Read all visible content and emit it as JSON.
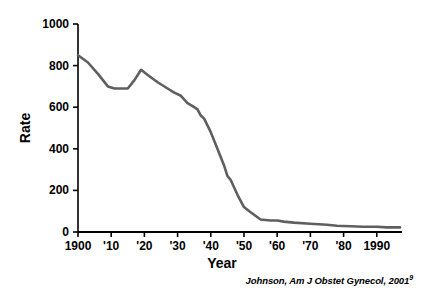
{
  "chart_data": {
    "type": "line",
    "title": "",
    "xlabel": "Year",
    "ylabel": "Rate",
    "xlim": [
      1900,
      1997
    ],
    "ylim": [
      0,
      1000
    ],
    "grid": false,
    "legend": null,
    "line_color": "#5f5f5f",
    "axis_color": "#000000",
    "xtick_labels": [
      "1900",
      "'10",
      "'20",
      "'30",
      "'40",
      "'50",
      "'60",
      "'70",
      "'80",
      "1990"
    ],
    "xtick_values": [
      1900,
      1910,
      1920,
      1930,
      1940,
      1950,
      1960,
      1970,
      1980,
      1990
    ],
    "ytick_labels": [
      "0",
      "200",
      "400",
      "600",
      "800",
      "1000"
    ],
    "ytick_values": [
      0,
      200,
      400,
      600,
      800,
      1000
    ],
    "x": [
      1900,
      1903,
      1906,
      1909,
      1911,
      1913,
      1915,
      1917,
      1919,
      1921,
      1924,
      1927,
      1929,
      1931,
      1933,
      1935,
      1936,
      1937,
      1938,
      1940,
      1942,
      1944,
      1945,
      1946,
      1948,
      1950,
      1952,
      1955,
      1958,
      1960,
      1962,
      1965,
      1970,
      1975,
      1978,
      1982,
      1986,
      1990,
      1993,
      1997
    ],
    "y": [
      850,
      815,
      760,
      700,
      690,
      690,
      690,
      730,
      780,
      755,
      720,
      690,
      670,
      655,
      620,
      600,
      590,
      560,
      545,
      480,
      400,
      320,
      270,
      250,
      180,
      120,
      95,
      60,
      55,
      55,
      50,
      45,
      40,
      35,
      30,
      28,
      25,
      25,
      22,
      22
    ]
  },
  "citation": {
    "text": "Johnson, Am J Obstet Gynecol, 2001",
    "superscript": "9"
  },
  "icons": {
    "axis_tick": "tick-mark"
  }
}
